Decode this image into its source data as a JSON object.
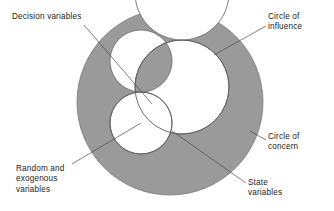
{
  "figure": {
    "colors": {
      "background": "#ffffff",
      "ring_fill": "#9a9a9a",
      "ring_stroke": "#6f6f6f",
      "influence_fill": "#ffffff",
      "random_fill": "#ffffff",
      "state_fill": "#1a1411",
      "leader_line": "#4a4a4a",
      "text": "#1c1c1c"
    },
    "shapes": {
      "circle_of_concern": {
        "cx": 170,
        "cy": 102,
        "r": 93
      },
      "circle_of_influence": {
        "cx": 182,
        "cy": 87,
        "r": 47
      },
      "random_exogenous": {
        "cx": 141,
        "cy": 123,
        "r": 31
      }
    }
  },
  "labels": {
    "decision_variables": {
      "text": "Decision variables",
      "lines": [
        "Decision variables"
      ]
    },
    "circle_of_influence": {
      "text": "Circle of\ninfluence",
      "lines": [
        "Circle of",
        "influence"
      ]
    },
    "circle_of_concern": {
      "text": "Circle of\nconcern",
      "lines": [
        "Circle of",
        "concern"
      ]
    },
    "random_exogenous_variables": {
      "text": "Random and\nexogenous\nvariables",
      "lines": [
        "Random and",
        "exogenous",
        "variables"
      ]
    },
    "state_variables": {
      "text": "State\nvariables",
      "lines": [
        "State",
        "variables"
      ]
    }
  },
  "leader_lines": [
    {
      "name": "decision-variables-leader",
      "x1": 84,
      "y1": 25,
      "x2": 152,
      "y2": 104
    },
    {
      "name": "circle-of-influence-leader",
      "x1": 266,
      "y1": 26,
      "x2": 214,
      "y2": 55
    },
    {
      "name": "circle-of-concern-leader",
      "x1": 266,
      "y1": 140,
      "x2": 250,
      "y2": 131
    },
    {
      "name": "random-exogenous-leader",
      "x1": 72,
      "y1": 164,
      "x2": 141,
      "y2": 123
    },
    {
      "name": "state-variables-leader",
      "x1": 246,
      "y1": 183,
      "x2": 172,
      "y2": 131
    }
  ]
}
